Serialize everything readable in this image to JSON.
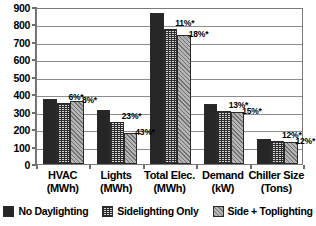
{
  "chart_data": {
    "type": "bar",
    "title": "",
    "subtitle": "",
    "xlabel": "",
    "ylabel": "",
    "ylim": [
      0,
      900
    ],
    "ytick_step": 100,
    "grid": true,
    "legend_position": "bottom",
    "categories": [
      {
        "line1": "HVAC",
        "line2": "(MWh)"
      },
      {
        "line1": "Lights",
        "line2": "(MWh)"
      },
      {
        "line1": "Total Elec.",
        "line2": "(MWh)"
      },
      {
        "line1": "Demand",
        "line2": "(kW)"
      },
      {
        "line1": "Chiller Size",
        "line2": "(Tons)"
      }
    ],
    "ytick_labels": [
      "900",
      "800",
      "700",
      "600",
      "500",
      "400",
      "300",
      "200",
      "100",
      "0"
    ],
    "ytick_values": [
      900,
      800,
      700,
      600,
      500,
      400,
      300,
      200,
      100,
      0
    ],
    "series": [
      {
        "name": "No Daylighting",
        "pattern": "solid-black",
        "color": "#262626",
        "values": [
          375,
          308,
          865,
          345,
          145
        ]
      },
      {
        "name": "Sidelighting Only",
        "pattern": "fine-grid",
        "color": "#d8d8d8",
        "values": [
          352,
          240,
          775,
          305,
          130
        ]
      },
      {
        "name": "Side + Toplighting",
        "pattern": "light-dots",
        "color": "#b4b4b4",
        "values": [
          360,
          178,
          740,
          300,
          128
        ]
      }
    ],
    "annotations": [
      {
        "category": "HVAC",
        "series": "Sidelighting Only",
        "text": "6%*"
      },
      {
        "category": "HVAC",
        "series": "Side + Toplighting",
        "text": "8%*"
      },
      {
        "category": "Lights",
        "series": "Sidelighting Only",
        "text": "23%*"
      },
      {
        "category": "Lights",
        "series": "Side + Toplighting",
        "text": "43%*"
      },
      {
        "category": "Total Elec.",
        "series": "Sidelighting Only",
        "text": "11%*"
      },
      {
        "category": "Total Elec.",
        "series": "Side + Toplighting",
        "text": "18%*"
      },
      {
        "category": "Demand",
        "series": "Sidelighting Only",
        "text": "13%*"
      },
      {
        "category": "Demand",
        "series": "Side + Toplighting",
        "text": "15%*"
      },
      {
        "category": "Chiller Size",
        "series": "Sidelighting Only",
        "text": "12%*"
      },
      {
        "category": "Chiller Size",
        "series": "Side + Toplighting",
        "text": "12%*"
      }
    ],
    "colors": {
      "series0": "#262626",
      "series1": "#d8d8d8",
      "series2": "#b4b4b4",
      "grid": "#8c8c8c",
      "axis": "#6e6e6e",
      "text": "#000000",
      "background": "#ffffff"
    }
  },
  "legend": {
    "items": [
      {
        "label": "No Daylighting"
      },
      {
        "label": "Sidelighting Only"
      },
      {
        "label": "Side + Toplighting"
      }
    ]
  }
}
